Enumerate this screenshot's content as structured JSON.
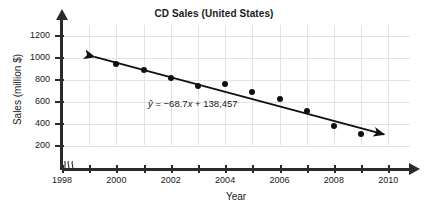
{
  "chart_data": {
    "type": "scatter",
    "title": "CD Sales (United States)",
    "xlabel": "Year",
    "ylabel": "Sales (million $)",
    "x": [
      2000,
      2001,
      2002,
      2003,
      2004,
      2005,
      2006,
      2007,
      2008,
      2009
    ],
    "values": [
      945,
      890,
      820,
      750,
      760,
      690,
      625,
      515,
      380,
      305
    ],
    "series": [
      {
        "name": "CD Sales",
        "values": [
          945,
          890,
          820,
          750,
          760,
          690,
          625,
          515,
          380,
          305
        ]
      }
    ],
    "xlim": [
      1998,
      2010.8
    ],
    "ylim": [
      0,
      1300
    ],
    "xticks": [
      1998,
      1999,
      2000,
      2001,
      2002,
      2003,
      2004,
      2005,
      2006,
      2007,
      2008,
      2009,
      2010
    ],
    "xtick_labels": [
      "1998",
      "",
      "2000",
      "",
      "2002",
      "",
      "2004",
      "",
      "2006",
      "",
      "2008",
      "",
      "2010"
    ],
    "yticks": [
      200,
      400,
      600,
      800,
      1000,
      1200
    ],
    "ytick_labels": [
      "200",
      "400",
      "600",
      "800",
      "1000",
      "1200"
    ],
    "grid": true,
    "legend": "none",
    "axis_break": "x-axis break between origin and 1998",
    "annotations": [
      {
        "name": "regression-equation",
        "text": "ŷ = −68.7x + 138,457",
        "slope": -68.7,
        "intercept": 138457,
        "x": 2002.0,
        "y": 590
      }
    ],
    "trendline": {
      "type": "linear-fit-double-arrow",
      "x_start": 1999.2,
      "y_start": 1010,
      "x_end": 2009.85,
      "y_end": 305,
      "arrows": "both"
    },
    "colors": {
      "background": "#ffffff",
      "axis": "#2b2b2b",
      "grid": "#e3e3e3",
      "point": "#111111",
      "line": "#111111",
      "text": "#1a1a1a"
    }
  },
  "equation": {
    "y_hat": "ŷ",
    "equals": "=",
    "body": "−68.7",
    "x_var": "x",
    "plus": "+ 138,457"
  }
}
